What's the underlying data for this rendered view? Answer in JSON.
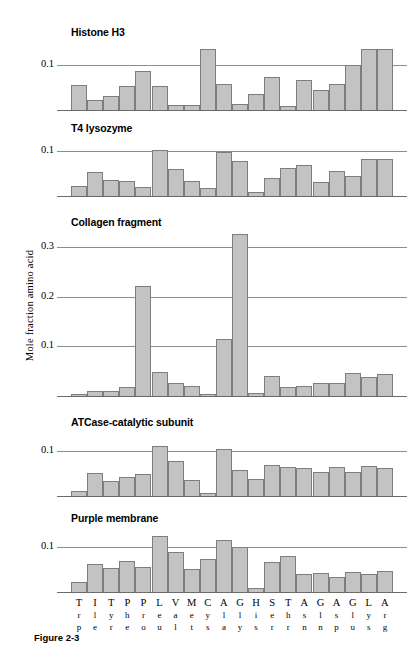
{
  "figure": {
    "caption": "Figure 2-3",
    "ylabel": "Mole fraction amino acid"
  },
  "chart_data": {
    "type": "bar",
    "title": "",
    "xlabel": "",
    "ylabel": "Mole fraction amino acid",
    "grid": true,
    "legend_position": "none",
    "categories": [
      "Trp",
      "Ile",
      "Tyr",
      "Phe",
      "Pro",
      "Leu",
      "Val",
      "Met",
      "Cys",
      "Ala",
      "Gly",
      "His",
      "Ser",
      "Thr",
      "Asn",
      "Gln",
      "Asp",
      "Glu",
      "Lys",
      "Arg"
    ],
    "category_letters": [
      {
        "l1": "T",
        "l2": "r",
        "l3": "p"
      },
      {
        "l1": "I",
        "l2": "l",
        "l3": "e"
      },
      {
        "l1": "T",
        "l2": "y",
        "l3": "r"
      },
      {
        "l1": "P",
        "l2": "h",
        "l3": "e"
      },
      {
        "l1": "P",
        "l2": "r",
        "l3": "o"
      },
      {
        "l1": "L",
        "l2": "e",
        "l3": "u"
      },
      {
        "l1": "V",
        "l2": "a",
        "l3": "l"
      },
      {
        "l1": "M",
        "l2": "e",
        "l3": "t"
      },
      {
        "l1": "C",
        "l2": "y",
        "l3": "s"
      },
      {
        "l1": "A",
        "l2": "l",
        "l3": "a"
      },
      {
        "l1": "G",
        "l2": "l",
        "l3": "y"
      },
      {
        "l1": "H",
        "l2": "i",
        "l3": "s"
      },
      {
        "l1": "S",
        "l2": "e",
        "l3": "r"
      },
      {
        "l1": "T",
        "l2": "h",
        "l3": "r"
      },
      {
        "l1": "A",
        "l2": "s",
        "l3": "n"
      },
      {
        "l1": "G",
        "l2": "l",
        "l3": "n"
      },
      {
        "l1": "A",
        "l2": "s",
        "l3": "p"
      },
      {
        "l1": "G",
        "l2": "l",
        "l3": "u"
      },
      {
        "l1": "L",
        "l2": "y",
        "l3": "s"
      },
      {
        "l1": "A",
        "l2": "r",
        "l3": "g"
      }
    ],
    "panels": [
      {
        "name": "Histone H3",
        "ylim": [
          0,
          0.155
        ],
        "yticks": [
          0.1
        ],
        "ytick_labels": [
          "0.1"
        ],
        "values": [
          0.055,
          0.022,
          0.03,
          0.052,
          0.085,
          0.053,
          0.012,
          0.012,
          0.135,
          0.058,
          0.013,
          0.035,
          0.072,
          0.008,
          0.065,
          0.043,
          0.058,
          0.098,
          0.135,
          0.135
        ]
      },
      {
        "name": "T4 lysozyme",
        "ylim": [
          0,
          0.112
        ],
        "yticks": [
          0.1
        ],
        "ytick_labels": [
          "0.1"
        ],
        "values": [
          0.022,
          0.052,
          0.035,
          0.033,
          0.02,
          0.102,
          0.06,
          0.033,
          0.018,
          0.096,
          0.078,
          0.008,
          0.04,
          0.062,
          0.068,
          0.03,
          0.055,
          0.045,
          0.082,
          0.082
        ]
      },
      {
        "name": "Collagen fragment",
        "ylim": [
          0,
          0.345
        ],
        "yticks": [
          0.1,
          0.2,
          0.3
        ],
        "ytick_labels": [
          "0.1",
          "0.2",
          "0.3"
        ],
        "values": [
          0.004,
          0.01,
          0.01,
          0.018,
          0.222,
          0.048,
          0.026,
          0.02,
          0.004,
          0.115,
          0.325,
          0.007,
          0.04,
          0.018,
          0.021,
          0.026,
          0.027,
          0.046,
          0.038,
          0.044
        ]
      },
      {
        "name": "ATCase-catalytic subunit",
        "ylim": [
          0,
          0.118
        ],
        "yticks": [
          0.1
        ],
        "ytick_labels": [
          "0.1"
        ],
        "values": [
          0.01,
          0.05,
          0.032,
          0.042,
          0.048,
          0.11,
          0.078,
          0.035,
          0.006,
          0.103,
          0.057,
          0.038,
          0.068,
          0.063,
          0.062,
          0.052,
          0.063,
          0.052,
          0.065,
          0.061
        ]
      },
      {
        "name": "Purple membrane",
        "ylim": [
          0,
          0.135
        ],
        "yticks": [
          0.1
        ],
        "ytick_labels": [
          "0.1"
        ],
        "values": [
          0.022,
          0.062,
          0.052,
          0.068,
          0.055,
          0.122,
          0.088,
          0.05,
          0.072,
          0.115,
          0.1,
          0.008,
          0.066,
          0.08,
          0.04,
          0.042,
          0.034,
          0.044,
          0.04,
          0.046
        ]
      }
    ]
  }
}
